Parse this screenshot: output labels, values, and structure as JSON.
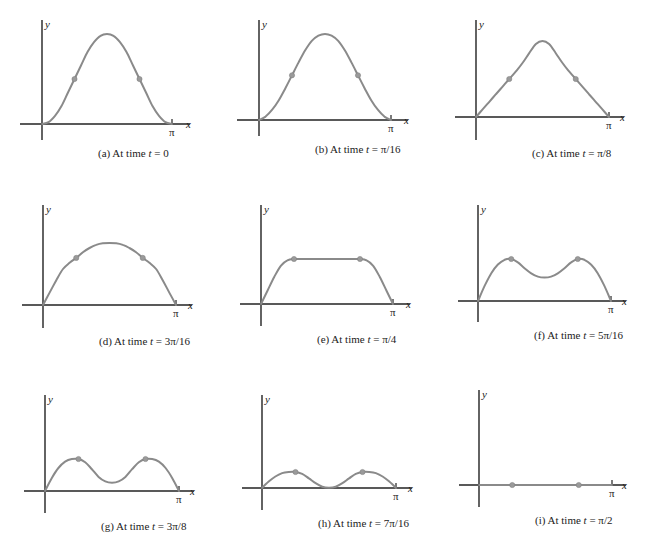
{
  "figure": {
    "curve_color": "#8a8a8a",
    "axis_color": "#222222",
    "axis_labels": {
      "x": "x",
      "y": "y",
      "x_tick": "π"
    },
    "panels": [
      {
        "id": "a",
        "caption": "(a) At time t = 0",
        "caption_prefix": "(a) At time ",
        "t_var": "t",
        "caption_value": " = 0",
        "origin": [
          42,
          124
        ],
        "y_top": 20,
        "y_bottom": 140,
        "x_left": 20,
        "x_right": 190,
        "pi_x": 172,
        "points": [
          [
            0,
            0
          ],
          [
            0.1,
            0.02
          ],
          [
            0.2,
            0.09
          ],
          [
            0.3,
            0.2
          ],
          [
            0.4,
            0.35
          ],
          [
            0.5,
            0.5
          ],
          [
            0.6,
            0.65
          ],
          [
            0.7,
            0.8
          ],
          [
            0.8,
            0.91
          ],
          [
            0.9,
            0.98
          ],
          [
            1,
            1
          ],
          [
            1.1,
            0.98
          ],
          [
            1.2,
            0.91
          ],
          [
            1.3,
            0.8
          ],
          [
            1.4,
            0.65
          ],
          [
            1.5,
            0.5
          ],
          [
            1.6,
            0.35
          ],
          [
            1.7,
            0.2
          ],
          [
            1.8,
            0.09
          ],
          [
            1.9,
            0.02
          ],
          [
            2,
            0
          ]
        ],
        "amp": 90,
        "dots": [
          0.5,
          1.5
        ]
      },
      {
        "id": "b",
        "caption": "(b) At time t = π/16",
        "caption_prefix": "(b) At time ",
        "t_var": "t",
        "caption_value": " = π/16",
        "origin": [
          259,
          120
        ],
        "y_top": 20,
        "y_bottom": 136,
        "x_left": 237,
        "x_right": 408,
        "pi_x": 391,
        "points": [
          [
            0,
            0
          ],
          [
            0.1,
            0.04
          ],
          [
            0.2,
            0.12
          ],
          [
            0.3,
            0.23
          ],
          [
            0.4,
            0.37
          ],
          [
            0.5,
            0.52
          ],
          [
            0.6,
            0.67
          ],
          [
            0.7,
            0.81
          ],
          [
            0.8,
            0.92
          ],
          [
            0.9,
            0.98
          ],
          [
            1,
            1
          ],
          [
            1.1,
            0.98
          ],
          [
            1.2,
            0.92
          ],
          [
            1.3,
            0.81
          ],
          [
            1.4,
            0.67
          ],
          [
            1.5,
            0.52
          ],
          [
            1.6,
            0.37
          ],
          [
            1.7,
            0.23
          ],
          [
            1.8,
            0.12
          ],
          [
            1.9,
            0.04
          ],
          [
            2,
            0
          ]
        ],
        "amp": 86,
        "dots": [
          0.5,
          1.5
        ]
      },
      {
        "id": "c",
        "caption": "(c) At time t = π/8",
        "caption_prefix": "(c) At time ",
        "t_var": "t",
        "caption_value": " = π/8",
        "origin": [
          476,
          117
        ],
        "y_top": 20,
        "y_bottom": 140,
        "x_left": 455,
        "x_right": 624,
        "pi_x": 609,
        "points": [
          [
            0,
            0
          ],
          [
            0.1,
            0.1
          ],
          [
            0.2,
            0.2
          ],
          [
            0.3,
            0.3
          ],
          [
            0.4,
            0.4
          ],
          [
            0.5,
            0.5
          ],
          [
            0.6,
            0.6
          ],
          [
            0.7,
            0.71
          ],
          [
            0.8,
            0.84
          ],
          [
            0.9,
            0.96
          ],
          [
            1,
            1
          ],
          [
            1.1,
            0.96
          ],
          [
            1.2,
            0.84
          ],
          [
            1.3,
            0.71
          ],
          [
            1.4,
            0.6
          ],
          [
            1.5,
            0.5
          ],
          [
            1.6,
            0.4
          ],
          [
            1.7,
            0.3
          ],
          [
            1.8,
            0.2
          ],
          [
            1.9,
            0.1
          ],
          [
            2,
            0
          ]
        ],
        "amp": 76,
        "dots": [
          0.5,
          1.5
        ]
      },
      {
        "id": "d",
        "caption": "(d) At time t = 3π/16",
        "caption_prefix": "(d) At time ",
        "t_var": "t",
        "caption_value": " = 3π/16",
        "origin": [
          43,
          305
        ],
        "y_top": 205,
        "y_bottom": 328,
        "x_left": 22,
        "x_right": 192,
        "pi_x": 176,
        "points": [
          [
            0,
            0
          ],
          [
            0.1,
            0.2
          ],
          [
            0.2,
            0.4
          ],
          [
            0.3,
            0.58
          ],
          [
            0.4,
            0.68
          ],
          [
            0.5,
            0.76
          ],
          [
            0.6,
            0.85
          ],
          [
            0.7,
            0.92
          ],
          [
            0.8,
            0.97
          ],
          [
            0.9,
            0.995
          ],
          [
            1,
            1
          ],
          [
            1.1,
            0.995
          ],
          [
            1.2,
            0.97
          ],
          [
            1.3,
            0.92
          ],
          [
            1.4,
            0.85
          ],
          [
            1.5,
            0.76
          ],
          [
            1.6,
            0.68
          ],
          [
            1.7,
            0.58
          ],
          [
            1.8,
            0.4
          ],
          [
            1.9,
            0.2
          ],
          [
            2,
            0
          ]
        ],
        "amp": 62,
        "dots": [
          0.5,
          1.5
        ]
      },
      {
        "id": "e",
        "caption": "(e) At time t = π/4",
        "caption_prefix": "(e) At time ",
        "t_var": "t",
        "caption_value": " = π/4",
        "origin": [
          261,
          304
        ],
        "y_top": 205,
        "y_bottom": 326,
        "x_left": 240,
        "x_right": 410,
        "pi_x": 393,
        "points": [
          [
            0,
            0
          ],
          [
            0.1,
            0.3
          ],
          [
            0.2,
            0.6
          ],
          [
            0.3,
            0.85
          ],
          [
            0.4,
            0.97
          ],
          [
            0.5,
            1
          ],
          [
            0.6,
            1
          ],
          [
            0.7,
            1
          ],
          [
            0.8,
            1
          ],
          [
            0.9,
            1
          ],
          [
            1,
            1
          ],
          [
            1.1,
            1
          ],
          [
            1.2,
            1
          ],
          [
            1.3,
            1
          ],
          [
            1.4,
            1
          ],
          [
            1.5,
            1
          ],
          [
            1.6,
            0.97
          ],
          [
            1.7,
            0.85
          ],
          [
            1.8,
            0.6
          ],
          [
            1.9,
            0.3
          ],
          [
            2,
            0
          ]
        ],
        "amp": 45,
        "dots": [
          0.5,
          1.5
        ]
      },
      {
        "id": "f",
        "caption": "(f) At time t = 5π/16",
        "caption_prefix": "(f) At time ",
        "t_var": "t",
        "caption_value": " = 5π/16",
        "origin": [
          478,
          301
        ],
        "y_top": 205,
        "y_bottom": 322,
        "x_left": 458,
        "x_right": 626,
        "pi_x": 611,
        "points": [
          [
            0,
            0
          ],
          [
            0.1,
            0.36
          ],
          [
            0.2,
            0.66
          ],
          [
            0.3,
            0.87
          ],
          [
            0.4,
            0.98
          ],
          [
            0.5,
            1
          ],
          [
            0.6,
            0.92
          ],
          [
            0.7,
            0.78
          ],
          [
            0.8,
            0.66
          ],
          [
            0.9,
            0.58
          ],
          [
            1,
            0.56
          ],
          [
            1.1,
            0.58
          ],
          [
            1.2,
            0.66
          ],
          [
            1.3,
            0.78
          ],
          [
            1.4,
            0.92
          ],
          [
            1.5,
            1
          ],
          [
            1.6,
            0.98
          ],
          [
            1.7,
            0.87
          ],
          [
            1.8,
            0.66
          ],
          [
            1.9,
            0.36
          ],
          [
            2,
            0
          ]
        ],
        "amp": 42,
        "dots": [
          0.5,
          1.5
        ]
      },
      {
        "id": "g",
        "caption": "(g) At time t = 3π/8",
        "caption_prefix": "(g) At time ",
        "t_var": "t",
        "caption_value": " = 3π/8",
        "origin": [
          45,
          491
        ],
        "y_top": 395,
        "y_bottom": 513,
        "x_left": 24,
        "x_right": 194,
        "pi_x": 179,
        "points": [
          [
            0,
            0
          ],
          [
            0.1,
            0.4
          ],
          [
            0.2,
            0.72
          ],
          [
            0.3,
            0.92
          ],
          [
            0.4,
            1
          ],
          [
            0.5,
            1
          ],
          [
            0.6,
            0.9
          ],
          [
            0.7,
            0.68
          ],
          [
            0.8,
            0.44
          ],
          [
            0.9,
            0.3
          ],
          [
            1,
            0.26
          ],
          [
            1.1,
            0.3
          ],
          [
            1.2,
            0.44
          ],
          [
            1.3,
            0.68
          ],
          [
            1.4,
            0.9
          ],
          [
            1.5,
            1
          ],
          [
            1.6,
            1
          ],
          [
            1.7,
            0.92
          ],
          [
            1.8,
            0.72
          ],
          [
            1.9,
            0.4
          ],
          [
            2,
            0
          ]
        ],
        "amp": 32,
        "dots": [
          0.5,
          1.5
        ]
      },
      {
        "id": "h",
        "caption": "(h) At time t = 7π/16",
        "caption_prefix": "(h) At time ",
        "t_var": "t",
        "caption_value": " = 7π/16",
        "origin": [
          262,
          488
        ],
        "y_top": 395,
        "y_bottom": 510,
        "x_left": 242,
        "x_right": 412,
        "pi_x": 396,
        "points": [
          [
            0,
            0
          ],
          [
            0.1,
            0.4
          ],
          [
            0.2,
            0.72
          ],
          [
            0.3,
            0.93
          ],
          [
            0.4,
            1
          ],
          [
            0.5,
            1
          ],
          [
            0.6,
            0.88
          ],
          [
            0.7,
            0.6
          ],
          [
            0.8,
            0.3
          ],
          [
            0.9,
            0.08
          ],
          [
            1,
            0.02
          ],
          [
            1.1,
            0.08
          ],
          [
            1.2,
            0.3
          ],
          [
            1.3,
            0.6
          ],
          [
            1.4,
            0.88
          ],
          [
            1.5,
            1
          ],
          [
            1.6,
            1
          ],
          [
            1.7,
            0.93
          ],
          [
            1.8,
            0.72
          ],
          [
            1.9,
            0.4
          ],
          [
            2,
            0
          ]
        ],
        "amp": 16,
        "dots": [
          0.5,
          1.5
        ]
      },
      {
        "id": "i",
        "caption": "(i) At time t = π/2",
        "caption_prefix": "(i) At time ",
        "t_var": "t",
        "caption_value": " = π/2",
        "origin": [
          479,
          485
        ],
        "y_top": 390,
        "y_bottom": 507,
        "x_left": 459,
        "x_right": 626,
        "pi_x": 612,
        "points": [
          [
            0,
            0
          ],
          [
            2,
            0
          ]
        ],
        "amp": 0,
        "dots": [
          0.5,
          1.5
        ]
      }
    ]
  },
  "chart_data": {
    "type": "line",
    "title": "",
    "xlabel": "x",
    "ylabel": "y",
    "x_tick_labels": [
      "π"
    ],
    "series": [
      {
        "name": "(a) At time t = 0",
        "shape": "bell, peak at x=π/2, relative height 1.00"
      },
      {
        "name": "(b) At time t = π/16",
        "shape": "bell, peak at x=π/2, relative height 0.96"
      },
      {
        "name": "(c) At time t = π/8",
        "shape": "triangular-ish peak, relative height 0.84"
      },
      {
        "name": "(d) At time t = 3π/16",
        "shape": "broad dome, relative height 0.69"
      },
      {
        "name": "(e) At time t = π/4",
        "shape": "flat top plateau, relative height 0.50"
      },
      {
        "name": "(f) At time t = 5π/16",
        "shape": "two humps with shallow dip, relative height 0.47"
      },
      {
        "name": "(g) At time t = 3π/8",
        "shape": "two humps with deeper dip, relative height 0.36"
      },
      {
        "name": "(h) At time t = 7π/16",
        "shape": "two small humps, dip near zero, relative height 0.18"
      },
      {
        "name": "(i) At time t = π/2",
        "shape": "flat line y = 0"
      }
    ]
  }
}
